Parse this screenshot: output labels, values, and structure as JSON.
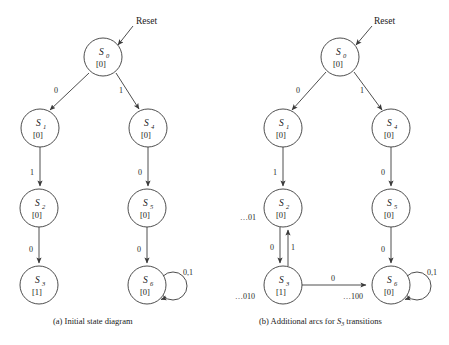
{
  "figure": {
    "reset_label": "Reset",
    "panels": [
      {
        "id": "a",
        "caption_prefix": "(a) Initial state diagram",
        "caption": "(a) Initial state diagram",
        "states": [
          {
            "key": "S0",
            "name": "S",
            "sub": "0",
            "output": "[0]",
            "cx": 103,
            "cy": 57
          },
          {
            "key": "S1",
            "name": "S",
            "sub": "1",
            "output": "[0]",
            "cx": 40,
            "cy": 128
          },
          {
            "key": "S2",
            "name": "S",
            "sub": "2",
            "output": "[0]",
            "cx": 39,
            "cy": 208
          },
          {
            "key": "S3",
            "name": "S",
            "sub": "3",
            "output": "[1]",
            "cx": 39,
            "cy": 285
          },
          {
            "key": "S4",
            "name": "S",
            "sub": "4",
            "output": "[0]",
            "cx": 148,
            "cy": 128
          },
          {
            "key": "S5",
            "name": "S",
            "sub": "5",
            "output": "[0]",
            "cx": 147,
            "cy": 208
          },
          {
            "key": "S6",
            "name": "S",
            "sub": "6",
            "output": "[0]",
            "cx": 147,
            "cy": 285
          }
        ],
        "transitions": [
          {
            "from": "S0",
            "to": "S1",
            "label": "0"
          },
          {
            "from": "S0",
            "to": "S4",
            "label": "1"
          },
          {
            "from": "S1",
            "to": "S2",
            "label": "1"
          },
          {
            "from": "S2",
            "to": "S3",
            "label": "0"
          },
          {
            "from": "S4",
            "to": "S5",
            "label": "0"
          },
          {
            "from": "S5",
            "to": "S6",
            "label": "0"
          },
          {
            "from": "S6",
            "to": "S6",
            "label": "0,1"
          }
        ],
        "sequence_labels": []
      },
      {
        "id": "b",
        "caption_prefix": "(b) Additional arcs for ",
        "caption_state": "S",
        "caption_state_sub": "3",
        "caption_suffix": " transitions",
        "caption": "(b) Additional arcs for S3 transitions",
        "states": [
          {
            "key": "S0",
            "name": "S",
            "sub": "0",
            "output": "[0]",
            "cx": 340,
            "cy": 57
          },
          {
            "key": "S1",
            "name": "S",
            "sub": "1",
            "output": "[0]",
            "cx": 283,
            "cy": 128
          },
          {
            "key": "S2",
            "name": "S",
            "sub": "2",
            "output": "[0]",
            "cx": 283,
            "cy": 208
          },
          {
            "key": "S3",
            "name": "S",
            "sub": "3",
            "output": "[1]",
            "cx": 283,
            "cy": 285
          },
          {
            "key": "S4",
            "name": "S",
            "sub": "4",
            "output": "[0]",
            "cx": 391,
            "cy": 128
          },
          {
            "key": "S5",
            "name": "S",
            "sub": "5",
            "output": "[0]",
            "cx": 391,
            "cy": 208
          },
          {
            "key": "S6",
            "name": "S",
            "sub": "6",
            "output": "[0]",
            "cx": 391,
            "cy": 285
          }
        ],
        "transitions": [
          {
            "from": "S0",
            "to": "S1",
            "label": "0"
          },
          {
            "from": "S0",
            "to": "S4",
            "label": "1"
          },
          {
            "from": "S1",
            "to": "S2",
            "label": "1"
          },
          {
            "from": "S2",
            "to": "S3",
            "label": "0"
          },
          {
            "from": "S3",
            "to": "S2",
            "label": "1"
          },
          {
            "from": "S3",
            "to": "S6",
            "label": "0"
          },
          {
            "from": "S4",
            "to": "S5",
            "label": "0"
          },
          {
            "from": "S5",
            "to": "S6",
            "label": "0"
          },
          {
            "from": "S6",
            "to": "S6",
            "label": "0,1"
          }
        ],
        "sequence_labels": [
          {
            "for_state": "S2",
            "text": "…01",
            "x": 260,
            "y": 220
          },
          {
            "for_state": "S3",
            "text": "…010",
            "x": 262,
            "y": 299
          },
          {
            "for_state": "S6",
            "text": "…100",
            "x": 370,
            "y": 299
          }
        ]
      }
    ]
  },
  "colors": {
    "stroke": "#3a3a3a",
    "text": "#1a1a1a",
    "background": "#ffffff"
  }
}
